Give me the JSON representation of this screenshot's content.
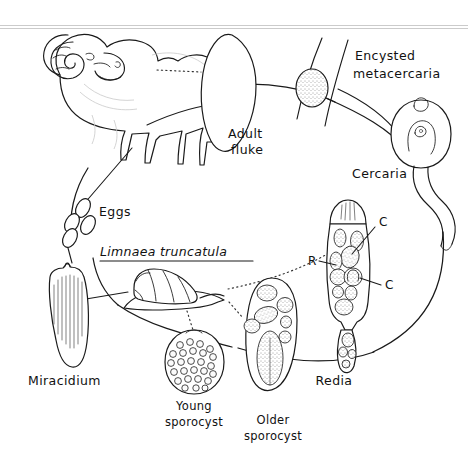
{
  "figure": {
    "background_color": "#ffffff",
    "ink_color": "#1a1a1a",
    "width": 468,
    "height": 459,
    "style": "hand-drawn black-and-white line illustration"
  },
  "labels": {
    "adult_fluke_line1": "Adult",
    "adult_fluke_line2": "fluke",
    "encysted_line1": "Encysted",
    "encysted_line2": "metacercaria",
    "cercaria": "Cercaria",
    "eggs": "Eggs",
    "snail_species": "Limnaea truncatula",
    "miracidium": "Miracidium",
    "young_sporocyst_line1": "Young",
    "young_sporocyst_line2": "sporocyst",
    "older_sporocyst_line1": "Older",
    "older_sporocyst_line2": "sporocyst",
    "redia": "Redia",
    "marker_r": "R",
    "marker_c_upper": "C",
    "marker_c_lower": "C"
  },
  "stages": [
    {
      "name": "definitive-host-sheep",
      "label": "",
      "note": "ram / sheep, definitive host",
      "order": 1
    },
    {
      "name": "adult-fluke",
      "label": "Adult fluke",
      "note": "leaf-shaped adult in host liver",
      "order": 2
    },
    {
      "name": "eggs",
      "label": "Eggs",
      "note": "four oval eggs passed in faeces",
      "order": 3
    },
    {
      "name": "miracidium",
      "label": "Miracidium",
      "note": "ciliated free-swimming larva",
      "order": 4
    },
    {
      "name": "snail-intermediate-host",
      "label": "Limnaea truncatula",
      "note": "mud snail intermediate host",
      "order": 5
    },
    {
      "name": "young-sporocyst",
      "label": "Young sporocyst",
      "note": "oval sac packed with germ cells",
      "order": 6
    },
    {
      "name": "older-sporocyst",
      "label": "Older sporocyst",
      "note": "elongated sac with developing rediae",
      "order": 7
    },
    {
      "name": "redia",
      "label": "Redia",
      "note": "contains daughter rediae (R) and cercariae (C)",
      "order": 8
    },
    {
      "name": "cercaria",
      "label": "Cercaria",
      "note": "tailed larva leaving the snail",
      "order": 9
    },
    {
      "name": "encysted-metacercaria",
      "label": "Encysted metacercaria",
      "note": "cyst attached to blade of grass",
      "order": 10
    }
  ],
  "annotations": [
    {
      "marker": "R",
      "meaning": "redia"
    },
    {
      "marker": "C",
      "meaning": "cercaria"
    }
  ]
}
